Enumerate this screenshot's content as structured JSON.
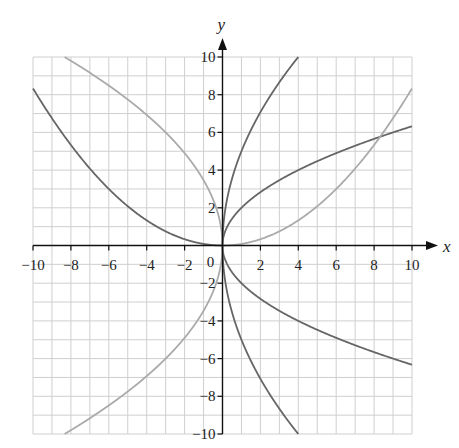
{
  "chart_data": {
    "type": "line",
    "title": "",
    "xlabel": "x",
    "ylabel": "y",
    "xlim": [
      -10,
      10
    ],
    "ylim": [
      -10,
      10
    ],
    "grid": true,
    "grid_step": 1,
    "xticks": [
      -10,
      -8,
      -6,
      -4,
      -2,
      0,
      2,
      4,
      6,
      8,
      10
    ],
    "yticks": [
      -10,
      -8,
      -6,
      -4,
      -2,
      2,
      4,
      6,
      8,
      10
    ],
    "xtick_labels": [
      "−10",
      "−8",
      "−6",
      "−4",
      "−2",
      "0",
      "2",
      "4",
      "6",
      "8",
      "10"
    ],
    "ytick_labels": [
      "−10",
      "−8",
      "−6",
      "−4",
      "−2",
      "2",
      "4",
      "6",
      "8",
      "10"
    ],
    "series": [
      {
        "name": "y = 5√x",
        "color": "#666666",
        "domain": [
          0,
          4
        ],
        "points": [
          [
            0,
            0
          ],
          [
            1,
            5
          ],
          [
            2,
            7.07
          ],
          [
            3,
            8.66
          ],
          [
            4,
            10
          ]
        ]
      },
      {
        "name": "y = 2√x",
        "color": "#666666",
        "domain": [
          0,
          10
        ],
        "points": [
          [
            0,
            0
          ],
          [
            2,
            2.83
          ],
          [
            4,
            4
          ],
          [
            6,
            4.9
          ],
          [
            8,
            5.66
          ],
          [
            10,
            6.32
          ]
        ]
      },
      {
        "name": "y = −5√x",
        "color": "#666666",
        "domain": [
          0,
          4
        ],
        "points": [
          [
            0,
            0
          ],
          [
            1,
            -5
          ],
          [
            2,
            -7.07
          ],
          [
            3,
            -8.66
          ],
          [
            4,
            -10
          ]
        ]
      },
      {
        "name": "y = −2√x",
        "color": "#666666",
        "domain": [
          0,
          10
        ],
        "points": [
          [
            0,
            0
          ],
          [
            2,
            -2.83
          ],
          [
            4,
            -4
          ],
          [
            6,
            -4.9
          ],
          [
            8,
            -5.66
          ],
          [
            10,
            -6.32
          ]
        ]
      },
      {
        "name": "y = x²/12 (x ≤ 0)",
        "color": "#666666",
        "domain": [
          -10,
          0
        ],
        "points": [
          [
            -10,
            8.33
          ],
          [
            -8,
            5.33
          ],
          [
            -6,
            3
          ],
          [
            -4,
            1.33
          ],
          [
            -2,
            0.33
          ],
          [
            0,
            0
          ]
        ]
      },
      {
        "name": "y = x²/12 (x ≥ 0)",
        "color": "#aaaaaa",
        "domain": [
          0,
          10
        ],
        "points": [
          [
            0,
            0
          ],
          [
            2,
            0.33
          ],
          [
            4,
            1.33
          ],
          [
            6,
            3
          ],
          [
            8,
            5.33
          ],
          [
            10,
            8.33
          ]
        ]
      },
      {
        "name": "y = √(−12x)",
        "color": "#aaaaaa",
        "domain": [
          -8.33,
          0
        ],
        "points": [
          [
            -8.33,
            10
          ],
          [
            -6,
            8.49
          ],
          [
            -4,
            6.93
          ],
          [
            -2,
            4.9
          ],
          [
            0,
            0
          ]
        ]
      },
      {
        "name": "y = −√(−12x)",
        "color": "#aaaaaa",
        "domain": [
          -8.33,
          0
        ],
        "points": [
          [
            -8.33,
            -10
          ],
          [
            -6,
            -8.49
          ],
          [
            -4,
            -6.93
          ],
          [
            -2,
            -4.9
          ],
          [
            0,
            0
          ]
        ]
      }
    ]
  },
  "axes": {
    "x_label": "x",
    "y_label": "y",
    "origin_label": "0"
  }
}
